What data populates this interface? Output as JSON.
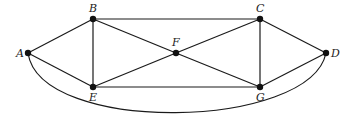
{
  "diagram": {
    "type": "graph",
    "nodes": [
      {
        "id": "A",
        "label": "A",
        "x": 28,
        "y": 53,
        "label_x": 16,
        "label_y": 57
      },
      {
        "id": "B",
        "label": "B",
        "x": 93,
        "y": 19,
        "label_x": 89,
        "label_y": 12
      },
      {
        "id": "C",
        "label": "C",
        "x": 260,
        "y": 19,
        "label_x": 256,
        "label_y": 12
      },
      {
        "id": "D",
        "label": "D",
        "x": 326,
        "y": 53,
        "label_x": 331,
        "label_y": 57
      },
      {
        "id": "E",
        "label": "E",
        "x": 93,
        "y": 87,
        "label_x": 89,
        "label_y": 101
      },
      {
        "id": "F",
        "label": "F",
        "x": 176,
        "y": 53,
        "label_x": 172,
        "label_y": 46
      },
      {
        "id": "G",
        "label": "G",
        "x": 260,
        "y": 87,
        "label_x": 256,
        "label_y": 101
      }
    ],
    "edges": [
      [
        "A",
        "B"
      ],
      [
        "A",
        "E"
      ],
      [
        "B",
        "C"
      ],
      [
        "B",
        "E"
      ],
      [
        "B",
        "F"
      ],
      [
        "E",
        "F"
      ],
      [
        "E",
        "G"
      ],
      [
        "F",
        "C"
      ],
      [
        "F",
        "G"
      ],
      [
        "C",
        "G"
      ],
      [
        "C",
        "D"
      ],
      [
        "G",
        "D"
      ]
    ],
    "curved_edges": [
      {
        "from": "A",
        "to": "D",
        "path": "M 28 53 C 40 135, 310 130, 326 53"
      }
    ],
    "colors": {
      "stroke": "#1a1a1a",
      "node": "#111111",
      "label": "#222222"
    }
  }
}
